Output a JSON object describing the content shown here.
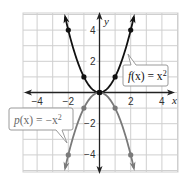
{
  "chart_data": {
    "type": "line",
    "title": "",
    "xlabel": "x",
    "ylabel": "y",
    "xlim": [
      -4.9,
      5.1
    ],
    "ylim": [
      -5.1,
      5.1
    ],
    "grid": true,
    "x_ticks": [
      -4,
      -2,
      2,
      4
    ],
    "y_ticks": [
      4,
      2,
      -2,
      -4
    ],
    "x_tick_labels": [
      "−4",
      "−2",
      "2",
      "4"
    ],
    "y_tick_labels": [
      "4",
      "2",
      "−2",
      "−4"
    ],
    "series": [
      {
        "name": "f(x) = x²",
        "expression": "x^2",
        "color": "#111111",
        "points": [
          [
            -2,
            4
          ],
          [
            -1,
            1
          ],
          [
            0,
            0
          ],
          [
            1,
            1
          ],
          [
            2,
            4
          ]
        ],
        "label": {
          "fn": "f",
          "arg": "(x)",
          "eq": " = x",
          "exp": "2"
        }
      },
      {
        "name": "p(x) = −x²",
        "expression": "-x^2",
        "color": "#7a7a7a",
        "points": [
          [
            -2,
            -4
          ],
          [
            -1,
            -1
          ],
          [
            0,
            0
          ],
          [
            1,
            -1
          ],
          [
            2,
            -4
          ]
        ],
        "label": {
          "fn": "p",
          "arg": "(x)",
          "eq": " = −x",
          "exp": "2"
        }
      }
    ]
  },
  "axes": {
    "x_label": "x",
    "y_label": "y"
  }
}
